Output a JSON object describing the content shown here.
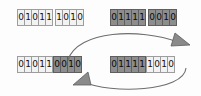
{
  "figure": {
    "colors": {
      "light_cell_fill": "#f2f2f2",
      "dark_cell_fill": "#8d8d8d",
      "cell_border": "#9a9a9a",
      "dark_cell_border": "#5f5f5f",
      "digit": "#111111",
      "arrow": "#6e6e6e",
      "background": "#fdfdfd"
    },
    "crossover_point": 5
  },
  "parents": [
    {
      "name": "parent-1",
      "row": "top",
      "side": "left",
      "bits": "010111010",
      "segments": [
        {
          "shade": "light",
          "bits": [
            "0",
            "1",
            "0",
            "1",
            "1"
          ]
        },
        {
          "shade": "light",
          "bits": [
            "1",
            "0",
            "1",
            "0"
          ]
        }
      ]
    },
    {
      "name": "parent-2",
      "row": "top",
      "side": "right",
      "bits": "011110010",
      "segments": [
        {
          "shade": "dark",
          "bits": [
            "0",
            "1",
            "1",
            "1",
            "1"
          ]
        },
        {
          "shade": "dark",
          "bits": [
            "0",
            "0",
            "1",
            "0"
          ]
        }
      ]
    }
  ],
  "offspring": [
    {
      "name": "child-1",
      "row": "bottom",
      "side": "left",
      "bits": "010110010",
      "segments": [
        {
          "shade": "light",
          "bits": [
            "0",
            "1",
            "0",
            "1",
            "1"
          ]
        },
        {
          "shade": "dark",
          "bits": [
            "0",
            "0",
            "1",
            "0"
          ]
        }
      ]
    },
    {
      "name": "child-2",
      "row": "bottom",
      "side": "right",
      "bits": "011111010",
      "segments": [
        {
          "shade": "dark",
          "bits": [
            "0",
            "1",
            "1",
            "1",
            "1"
          ]
        },
        {
          "shade": "light",
          "bits": [
            "1",
            "0",
            "1",
            "0"
          ]
        }
      ]
    }
  ],
  "arrows": [
    {
      "name": "swap-arrow-left-to-right",
      "from": "child-1 tail segment",
      "to": "child-2 tail segment",
      "direction": "rightward-over-top"
    },
    {
      "name": "swap-arrow-right-to-left",
      "from": "child-2 tail segment",
      "to": "child-1 tail segment",
      "direction": "leftward-under-bottom"
    }
  ]
}
